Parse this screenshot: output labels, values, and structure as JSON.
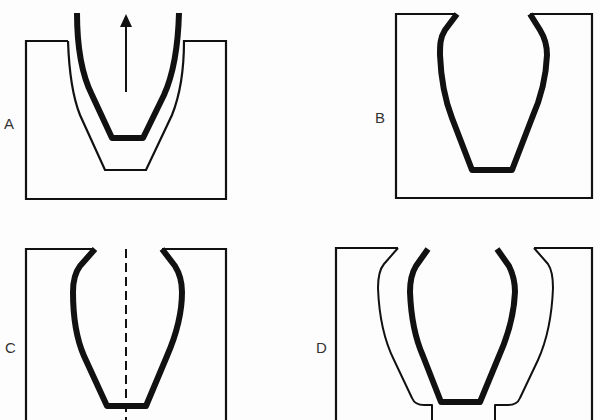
{
  "figure": {
    "panels": [
      {
        "id": "A",
        "label": "A",
        "description": "Crucible being withdrawn from mould cavity",
        "has_arrow": true
      },
      {
        "id": "B",
        "label": "B",
        "description": "Mould with crucible-shaped cavity wall"
      },
      {
        "id": "C",
        "label": "C",
        "description": "Mould cross-section with central axis"
      },
      {
        "id": "D",
        "label": "D",
        "description": "Crucible inside mould with gap and bottom opening"
      }
    ],
    "colors": {
      "ink": "#111111",
      "background": "#fdfdfd"
    }
  }
}
